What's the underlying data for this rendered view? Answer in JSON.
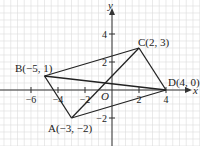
{
  "diagram": {
    "type": "coordinate-plane",
    "grid_step": 0.5,
    "x_range": [
      -8.25,
      6.5
    ],
    "y_range": [
      -4,
      6.3
    ],
    "axes": {
      "x_label": "x",
      "y_label": "y",
      "origin_label": "O"
    },
    "x_ticks": [
      {
        "value": -6,
        "label": "−6"
      },
      {
        "value": -4,
        "label": "−4"
      },
      {
        "value": -2,
        "label": "−2"
      },
      {
        "value": 2,
        "label": "2"
      },
      {
        "value": 4,
        "label": "4"
      }
    ],
    "y_ticks": [
      {
        "value": 4,
        "label": "4"
      },
      {
        "value": 2,
        "label": "2"
      },
      {
        "value": -2,
        "label": "−2"
      }
    ],
    "points": [
      {
        "name": "A",
        "x": -3,
        "y": -2,
        "label": "A(−3, −2)"
      },
      {
        "name": "B",
        "x": -5,
        "y": 1,
        "label": "B(−5, 1)"
      },
      {
        "name": "C",
        "x": 2,
        "y": 3,
        "label": "C(2, 3)"
      },
      {
        "name": "D",
        "x": 4,
        "y": 0,
        "label": "D(4, 0)"
      }
    ],
    "segments": [
      [
        "B",
        "C"
      ],
      [
        "C",
        "D"
      ],
      [
        "B",
        "D"
      ],
      [
        "A",
        "B"
      ],
      [
        "A",
        "C"
      ],
      [
        "A",
        "D"
      ]
    ],
    "colors": {
      "grid": "#dcdcdc",
      "axis": "#333333",
      "segment": "#222222"
    }
  }
}
